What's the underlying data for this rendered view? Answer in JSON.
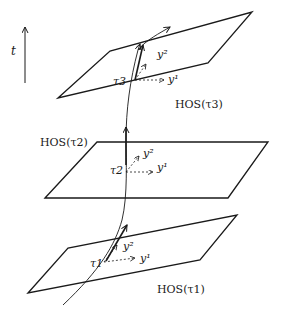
{
  "figure": {
    "time_axis": {
      "label": "t"
    },
    "planes": [
      {
        "id": "tau3",
        "label": "HOS(τ3)",
        "point_label": "τ3",
        "basis": [
          "y¹",
          "y²"
        ]
      },
      {
        "id": "tau2",
        "label": "HOS(τ2)",
        "point_label": "τ2",
        "basis": [
          "y¹",
          "y²"
        ]
      },
      {
        "id": "tau1",
        "label": "HOS(τ1)",
        "point_label": "τ1",
        "basis": [
          "y¹",
          "y²"
        ]
      }
    ],
    "colors": {
      "line": "#1a1a1a",
      "background": "#ffffff"
    }
  }
}
